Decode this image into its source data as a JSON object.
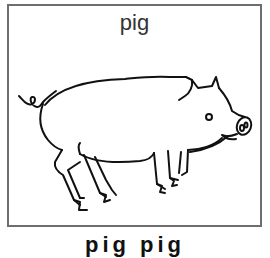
{
  "card": {
    "title": "pig",
    "illustration": "pig-line-drawing",
    "border_color": "#6e6e6e"
  },
  "caption": {
    "text": "pig pig"
  }
}
